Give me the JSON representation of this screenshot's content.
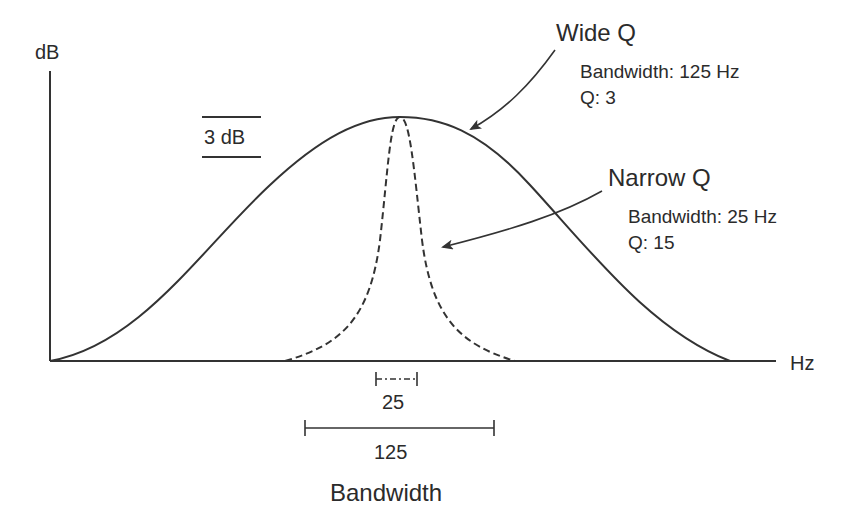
{
  "axes": {
    "y_label": "dB",
    "x_label": "Hz"
  },
  "scale_marker": {
    "label": "3 dB"
  },
  "wide_q": {
    "title": "Wide Q",
    "bandwidth_label": "Bandwidth: 125 Hz",
    "q_label": "Q: 3"
  },
  "narrow_q": {
    "title": "Narrow Q",
    "bandwidth_label": "Bandwidth: 25 Hz",
    "q_label": "Q: 15"
  },
  "bandwidth_markers": {
    "narrow_value": "25",
    "wide_value": "125",
    "caption": "Bandwidth"
  },
  "colors": {
    "line": "#333333",
    "text": "#2b2b2b",
    "background": "#ffffff"
  }
}
